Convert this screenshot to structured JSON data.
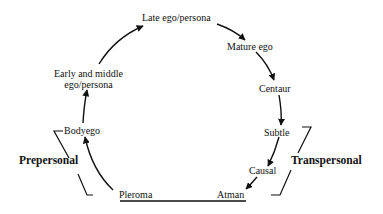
{
  "diagram": {
    "nodes": [
      {
        "id": "pleroma",
        "label": "Pleroma"
      },
      {
        "id": "bodyego",
        "label": "Bodyego"
      },
      {
        "id": "early_middle",
        "label_line1": "Early and middle",
        "label_line2": "ego/persona"
      },
      {
        "id": "late_ego",
        "label": "Late ego/persona"
      },
      {
        "id": "mature_ego",
        "label": "Mature ego"
      },
      {
        "id": "centaur",
        "label": "Centaur"
      },
      {
        "id": "subtle",
        "label": "Subtle"
      },
      {
        "id": "causal",
        "label": "Causal"
      },
      {
        "id": "atman",
        "label": "Atman"
      }
    ],
    "groups": {
      "prepersonal": "Prepersonal",
      "transpersonal": "Transpersonal"
    },
    "edges": [
      [
        "pleroma",
        "bodyego"
      ],
      [
        "bodyego",
        "early_middle"
      ],
      [
        "early_middle",
        "late_ego"
      ],
      [
        "late_ego",
        "mature_ego"
      ],
      [
        "mature_ego",
        "centaur"
      ],
      [
        "centaur",
        "subtle"
      ],
      [
        "subtle",
        "causal"
      ],
      [
        "causal",
        "atman"
      ]
    ]
  }
}
